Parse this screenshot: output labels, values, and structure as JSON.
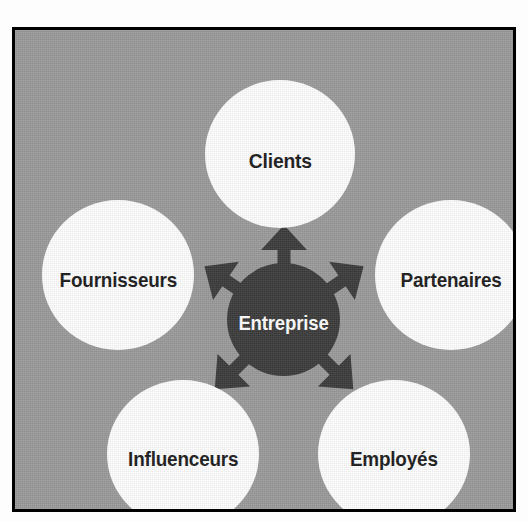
{
  "diagram": {
    "type": "hub-and-spoke",
    "frame": {
      "background_color": "#9a9a9a",
      "border_color": "#000000"
    },
    "center": {
      "id": "entreprise",
      "label": "Entreprise",
      "fill_color": "#3a3a3a",
      "text_color": "#ffffff"
    },
    "nodes": [
      {
        "id": "clients",
        "label": "Clients",
        "position": "top",
        "fill_color": "#ffffff",
        "text_color": "#1a1a1a"
      },
      {
        "id": "partenaires",
        "label": "Partenaires",
        "position": "right",
        "fill_color": "#ffffff",
        "text_color": "#1a1a1a"
      },
      {
        "id": "employes",
        "label": "Employés",
        "position": "bottom-right",
        "fill_color": "#ffffff",
        "text_color": "#1a1a1a"
      },
      {
        "id": "influenceurs",
        "label": "Influenceurs",
        "position": "bottom-left",
        "fill_color": "#ffffff",
        "text_color": "#1a1a1a"
      },
      {
        "id": "fournisseurs",
        "label": "Fournisseurs",
        "position": "left",
        "fill_color": "#ffffff",
        "text_color": "#1a1a1a"
      }
    ],
    "connectors": [
      {
        "id": "arrow-up",
        "from": "entreprise",
        "to": "clients",
        "style": "block-arrow",
        "color": "#3a3a3a"
      },
      {
        "id": "arrow-upper-left",
        "from": "entreprise",
        "to": "fournisseurs",
        "style": "block-arrow",
        "color": "#3a3a3a"
      },
      {
        "id": "arrow-upper-right",
        "from": "entreprise",
        "to": "partenaires",
        "style": "block-arrow",
        "color": "#3a3a3a"
      },
      {
        "id": "arrow-lower-left",
        "from": "entreprise",
        "to": "influenceurs",
        "style": "block-arrow",
        "color": "#3a3a3a"
      },
      {
        "id": "arrow-lower-right",
        "from": "entreprise",
        "to": "employes",
        "style": "block-arrow",
        "color": "#3a3a3a"
      }
    ]
  }
}
